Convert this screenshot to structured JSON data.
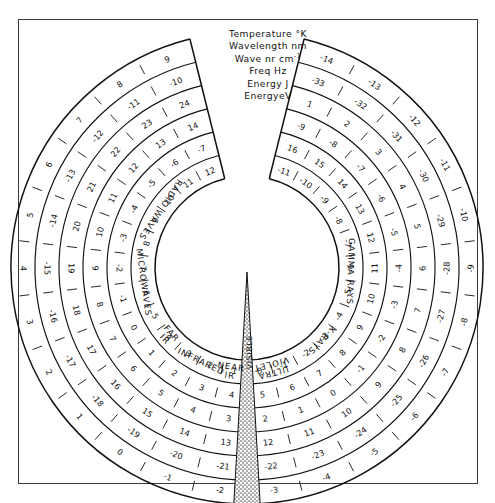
{
  "figure": {
    "type": "radial-spectrum-chart",
    "border_color": "#3a3a3a",
    "ink_color": "#111111",
    "background": "#ffffff",
    "visible_wedge_fill": "#9a9a9a"
  },
  "legend": {
    "position": "top-center",
    "items": [
      {
        "label": "Temperature °K",
        "ring": 1
      },
      {
        "label": "Wavelength nm",
        "ring": 2
      },
      {
        "label": "Wave nr cm",
        "sup": "-1",
        "ring": 3
      },
      {
        "label": "Freq Hz",
        "ring": 4
      },
      {
        "label": "Energy J",
        "ring": 5
      },
      {
        "label": "EnergyeV",
        "ring": 6
      }
    ]
  },
  "band_labels": [
    {
      "name": "RADIO WAVES",
      "side": "left"
    },
    {
      "name": "MICROWAVES",
      "side": "left"
    },
    {
      "name": "FAR IR",
      "side": "left"
    },
    {
      "name": "INFRARED",
      "side": "left"
    },
    {
      "name": "NEAR IR",
      "side": "left"
    },
    {
      "name": "VISIBLE",
      "side": "bottom-center"
    },
    {
      "name": "ULTRA VIOLET",
      "side": "right"
    },
    {
      "name": "X-RAYS",
      "side": "right"
    },
    {
      "name": "GAMMA RAYS",
      "side": "right"
    }
  ],
  "chart_data": {
    "type": "line",
    "subtype": "polar concentric logarithmic scales",
    "xlabel": "",
    "ylabel": "",
    "grid": true,
    "legend_position": "top-center",
    "angle_range_deg": {
      "start": -76,
      "end": 256,
      "direction": "clockwise-from-upper-left"
    },
    "series": [
      {
        "name": "Temperature °K",
        "ring": 1,
        "ring_radius_px": 116,
        "unit": "K",
        "tick_labels": [
          "-11",
          "-10",
          "-9",
          "-8",
          "-7",
          "-6",
          "-5",
          "-4",
          "-3",
          "-2",
          "-1",
          "0",
          "1",
          "2",
          "3",
          "4",
          "5",
          "6",
          "7",
          "8",
          "9",
          "10",
          "11",
          "12"
        ]
      },
      {
        "name": "Wavelength nm",
        "ring": 2,
        "ring_radius_px": 140,
        "unit": "nm",
        "tick_labels": [
          "16",
          "15",
          "14",
          "13",
          "12",
          "11",
          "10",
          "9",
          "8",
          "7",
          "6",
          "5",
          "4",
          "3",
          "2",
          "1",
          "0",
          "-1",
          "-2",
          "-3",
          "-4",
          "-5",
          "-6",
          "-7"
        ]
      },
      {
        "name": "Wave nr cm-1",
        "ring": 3,
        "ring_radius_px": 164,
        "unit": "cm^-1",
        "tick_labels": [
          "-9",
          "-8",
          "-7",
          "-6",
          "-5",
          "-4",
          "-3",
          "-2",
          "-1",
          "0",
          "1",
          "2",
          "3",
          "4",
          "5",
          "6",
          "7",
          "8",
          "9",
          "10",
          "11",
          "12",
          "13",
          "14"
        ]
      },
      {
        "name": "Freq Hz",
        "ring": 4,
        "ring_radius_px": 188,
        "unit": "Hz",
        "tick_labels": [
          "1",
          "2",
          "3",
          "4",
          "5",
          "6",
          "7",
          "8",
          "9",
          "10",
          "11",
          "12",
          "13",
          "14",
          "15",
          "16",
          "17",
          "18",
          "19",
          "20",
          "21",
          "22",
          "23",
          "24"
        ]
      },
      {
        "name": "Energy J",
        "ring": 5,
        "ring_radius_px": 212,
        "unit": "J",
        "tick_labels": [
          "-33",
          "-32",
          "-31",
          "-30",
          "-29",
          "-28",
          "-27",
          "-26",
          "-25",
          "-24",
          "-23",
          "-22",
          "-21",
          "-20",
          "-19",
          "-18",
          "-17",
          "-16",
          "-15",
          "-14",
          "-13",
          "-12",
          "-11",
          "-10"
        ]
      },
      {
        "name": "EnergyeV",
        "ring": 6,
        "ring_radius_px": 236,
        "unit": "eV",
        "tick_labels": [
          "-14",
          "-13",
          "-12",
          "-11",
          "-10",
          "-9",
          "-8",
          "-7",
          "-6",
          "-5",
          "-4",
          "-3",
          "-2",
          "-1",
          "0",
          "1",
          "2",
          "3",
          "4",
          "5",
          "6",
          "7",
          "8",
          "9"
        ]
      }
    ]
  },
  "geometry": {
    "center_x": 247,
    "center_y": 268,
    "gap_half_angle_deg": 14,
    "visible_wedge_center_deg": 90,
    "visible_wedge_half_angle_deg": 3.2
  }
}
